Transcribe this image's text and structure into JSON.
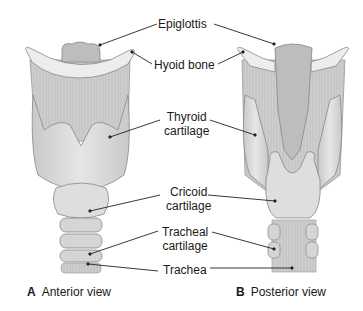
{
  "labels": {
    "epiglottis": "Epiglottis",
    "hyoid": "Hyoid bone",
    "thyroid_1": "Thyroid",
    "thyroid_2": "cartilage",
    "cricoid_1": "Cricoid",
    "cricoid_2": "cartilage",
    "tracheal_1": "Tracheal",
    "tracheal_2": "cartilage",
    "trachea": "Trachea"
  },
  "captions": {
    "a_letter": "A",
    "a_text": "Anterior view",
    "b_letter": "B",
    "b_text": "Posterior view"
  },
  "colors": {
    "cartilage": "#dcdcdc",
    "cartilage_dark": "#b8b8b8",
    "membrane": "#c8c8c8",
    "outline": "#8a8a8a",
    "leader": "#222222"
  }
}
